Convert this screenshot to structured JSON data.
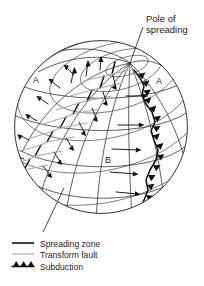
{
  "figure": {
    "title_annotation": "Pole of spreading",
    "plate_labels": [
      {
        "id": "plate-a-left",
        "text": "A",
        "x": 37,
        "y": 80
      },
      {
        "id": "plate-a-right",
        "text": "A",
        "x": 159,
        "y": 81
      },
      {
        "id": "plate-b",
        "text": "B",
        "x": 108,
        "y": 160
      }
    ],
    "annotation": {
      "text_line1": "Pole of",
      "text_line2": "spreading",
      "x": 146,
      "y": 22
    },
    "legend": {
      "items": [
        {
          "symbol": "solid-line-dark",
          "label": "Spreading zone",
          "color": "#111111"
        },
        {
          "symbol": "solid-line-gray",
          "label": "Transform fault",
          "color": "#b3b3b3"
        },
        {
          "symbol": "triangle-teeth",
          "label": "Subduction",
          "color": "#0d0d0d"
        }
      ]
    },
    "globe": {
      "center_x": 101,
      "center_y": 127,
      "radius": 87,
      "pole_x": 130,
      "pole_y": 63
    },
    "colors": {
      "background": "#ffffff",
      "outline": "#1c1c1c",
      "grid": "#2b2b2b",
      "ridge": "#111111",
      "transform_fault": "#aaaaaa",
      "subduction": "#0d0d0d",
      "text": "#1a1a1a"
    },
    "diagram_type": "plate-tectonics-globe",
    "description_items": [
      "spreading ridge with offsetting transform faults on left hemisphere",
      "subduction zone with teeth on right limb of globe",
      "divergent motion arrows either side of ridge",
      "convergent motion arrows toward subduction zone",
      "small circles about the pole of spreading"
    ]
  }
}
